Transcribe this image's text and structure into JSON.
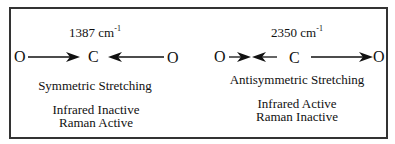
{
  "diagram": {
    "left_mode": {
      "frequency": "1387 cm",
      "frequency_exp": "-1",
      "atoms": [
        "O",
        "C",
        "O"
      ],
      "name": "Symmetric Stretching",
      "infrared": "Infrared Inactive",
      "raman": "Raman Active"
    },
    "right_mode": {
      "frequency": "2350 cm",
      "frequency_exp": "-1",
      "atoms": [
        "O",
        "C",
        "O"
      ],
      "name": "Antisymmetric Stretching",
      "infrared": "Infrared Active",
      "raman": "Raman Inactive"
    },
    "colors": {
      "ink": "#111111",
      "border": "#333333",
      "background": "#ffffff"
    }
  }
}
